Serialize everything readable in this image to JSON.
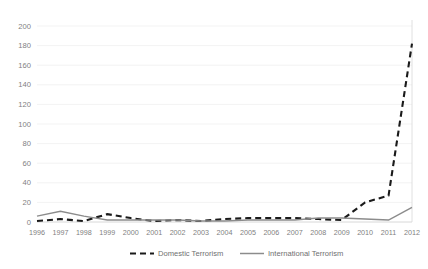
{
  "chart_data": {
    "type": "line",
    "title": "",
    "subtitle": "",
    "xlabel": "",
    "ylabel": "",
    "xlim": [
      1996,
      2012
    ],
    "ylim": [
      0,
      200
    ],
    "ytick_step": 20,
    "grid": true,
    "legend_position": "bottom",
    "categories": [
      "1996",
      "1997",
      "1998",
      "1999",
      "2000",
      "2001",
      "2002",
      "2003",
      "2004",
      "2005",
      "2006",
      "2007",
      "2008",
      "2009",
      "2010",
      "2011",
      "2012"
    ],
    "x": [
      1996,
      1997,
      1998,
      1999,
      2000,
      2001,
      2002,
      2003,
      2004,
      2005,
      2006,
      2007,
      2008,
      2009,
      2010,
      2011,
      2012
    ],
    "yticks": [
      0,
      20,
      40,
      60,
      80,
      100,
      120,
      140,
      160,
      180,
      200
    ],
    "ytick_labels": [
      "0",
      "20",
      "40",
      "60",
      "80",
      "100",
      "120",
      "140",
      "160",
      "180",
      "200"
    ],
    "series": [
      {
        "name": "Domestic Terrorism",
        "style": "dashed",
        "color": "#1a1a1a",
        "values": [
          1,
          3,
          1,
          8,
          4,
          1,
          2,
          1,
          3,
          4,
          4,
          4,
          3,
          2,
          20,
          27,
          182
        ]
      },
      {
        "name": "International Terrorism",
        "style": "solid",
        "color": "#8c8c8c",
        "values": [
          6,
          11,
          6,
          2,
          2,
          2,
          2,
          1,
          1,
          2,
          2,
          2,
          4,
          4,
          3,
          2,
          15
        ]
      }
    ]
  },
  "legend": {
    "items": [
      {
        "label": "Domestic Terrorism",
        "style": "dashed",
        "color": "#1a1a1a"
      },
      {
        "label": "International Terrorism",
        "style": "solid",
        "color": "#8c8c8c"
      }
    ]
  },
  "colors": {
    "background": "#ffffff",
    "gridline": "#eeeeee",
    "axis": "#d8d8d8",
    "tick_text": "#7f7f7f",
    "domestic": "#1a1a1a",
    "international": "#8c8c8c"
  }
}
